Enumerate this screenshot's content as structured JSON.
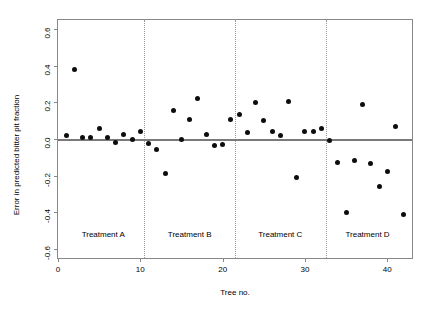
{
  "chart_data": {
    "type": "scatter",
    "title": "",
    "xlabel": "Tree no.",
    "ylabel": "Error in predicted bitter pit fraction",
    "xlim": [
      0,
      43
    ],
    "ylim": [
      -0.65,
      0.65
    ],
    "grid": false,
    "legend": "none",
    "xticks": [
      0,
      10,
      20,
      30,
      40
    ],
    "xtick_labels": [
      "0",
      "10",
      "20",
      "30",
      "40"
    ],
    "yticks": [
      0.6,
      0.4,
      0.2,
      0.0,
      -0.2,
      -0.4,
      -0.6
    ],
    "ytick_labels": [
      "0.6",
      "0.4",
      "0.2",
      "0.0",
      "-0.2",
      "-0.4",
      "-0.6"
    ],
    "reference_lines": [
      {
        "name": "zero-line",
        "orientation": "horizontal",
        "y": 0.0
      }
    ],
    "dividers": [
      {
        "name": "divider-a-b",
        "x": 10.5
      },
      {
        "name": "divider-b-c",
        "x": 21.5
      },
      {
        "name": "divider-c-d",
        "x": 32.5
      }
    ],
    "annotations": [
      {
        "name": "treatment-a-label",
        "text": "Treatment A",
        "x": 5.5,
        "y": -0.52
      },
      {
        "name": "treatment-b-label",
        "text": "Treatment B",
        "x": 16.0,
        "y": -0.52
      },
      {
        "name": "treatment-c-label",
        "text": "Treatment C",
        "x": 27.0,
        "y": -0.52
      },
      {
        "name": "treatment-d-label",
        "text": "Treatment D",
        "x": 37.6,
        "y": -0.52
      }
    ],
    "series": [
      {
        "name": "Error in predicted bitter pit fraction",
        "marker": "filled-circle",
        "color": "#0d0d0d",
        "x": [
          1,
          2,
          3,
          4,
          5,
          6,
          7,
          8,
          9,
          10,
          11,
          12,
          13,
          14,
          15,
          16,
          17,
          18,
          19,
          20,
          21,
          22,
          23,
          24,
          25,
          26,
          27,
          28,
          29,
          30,
          31,
          32,
          33,
          34,
          35,
          36,
          37,
          38,
          39,
          40,
          41,
          42
        ],
        "y": [
          0.02,
          0.38,
          0.01,
          0.01,
          0.055,
          0.01,
          -0.02,
          0.025,
          0.0,
          0.04,
          -0.025,
          -0.055,
          -0.19,
          0.155,
          0.0,
          0.105,
          0.22,
          0.025,
          -0.035,
          -0.03,
          0.105,
          0.135,
          0.035,
          0.2,
          0.1,
          0.04,
          0.02,
          0.205,
          -0.21,
          0.04,
          0.04,
          0.06,
          -0.01,
          -0.13,
          -0.4,
          -0.115,
          0.19,
          -0.135,
          -0.26,
          -0.175,
          0.07,
          -0.41
        ]
      }
    ]
  }
}
